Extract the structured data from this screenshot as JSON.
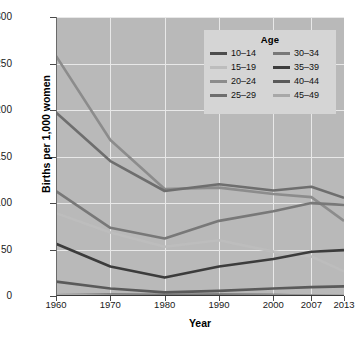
{
  "chart_data": {
    "type": "line",
    "title": "",
    "xlabel": "Year",
    "ylabel": "Births per 1,000 women",
    "x": [
      "1960",
      "1970",
      "1980",
      "1990",
      "2000",
      "2007",
      "2013"
    ],
    "x_positions": [
      0,
      17.5,
      35,
      52.5,
      70,
      82.3,
      92.8
    ],
    "ylim": [
      0,
      300
    ],
    "yticks": [
      0,
      50,
      100,
      150,
      200,
      250,
      300
    ],
    "ytick_labels": [
      "0",
      "50",
      "100",
      "150",
      "200",
      "250",
      "300"
    ],
    "grid": true,
    "legend_title": "Age",
    "legend_position": "top-right",
    "plot_background": "#b9b9b9",
    "series": [
      {
        "name": "10–14",
        "color": "#4d4d4d",
        "values": [
          0.8,
          1.2,
          1.1,
          1.4,
          0.9,
          0.6,
          0.3
        ]
      },
      {
        "name": "15–19",
        "color": "#bdbdbd",
        "values": [
          89.1,
          68.3,
          53.0,
          59.9,
          47.7,
          42.5,
          26.5
        ]
      },
      {
        "name": "20–24",
        "color": "#8c8c8c",
        "values": [
          258.1,
          167.8,
          115.1,
          116.5,
          109.7,
          106.3,
          80.7
        ]
      },
      {
        "name": "25–29",
        "color": "#6e6e6e",
        "values": [
          197.4,
          145.1,
          112.9,
          120.2,
          113.5,
          117.5,
          105.5
        ]
      },
      {
        "name": "30–34",
        "color": "#787878",
        "values": [
          112.7,
          73.3,
          61.9,
          80.8,
          91.2,
          99.9,
          98.0
        ]
      },
      {
        "name": "35–39",
        "color": "#3c3c3c",
        "values": [
          56.2,
          31.7,
          19.8,
          31.7,
          39.7,
          47.5,
          49.3
        ]
      },
      {
        "name": "40–44",
        "color": "#5a5a5a",
        "values": [
          15.5,
          8.1,
          3.9,
          5.5,
          8.0,
          9.5,
          10.4
        ]
      },
      {
        "name": "45–49",
        "color": "#a8a8a8",
        "values": [
          0.9,
          0.5,
          0.2,
          0.2,
          0.5,
          0.6,
          0.8
        ]
      }
    ]
  },
  "axis": {
    "y_title": "Births per 1,000 women",
    "x_title": "Year"
  },
  "legend": {
    "title": "Age",
    "column_left": [
      "10–14",
      "15–19",
      "20–24",
      "25–29"
    ],
    "column_right": [
      "30–34",
      "35–39",
      "40–44",
      "45–49"
    ]
  }
}
